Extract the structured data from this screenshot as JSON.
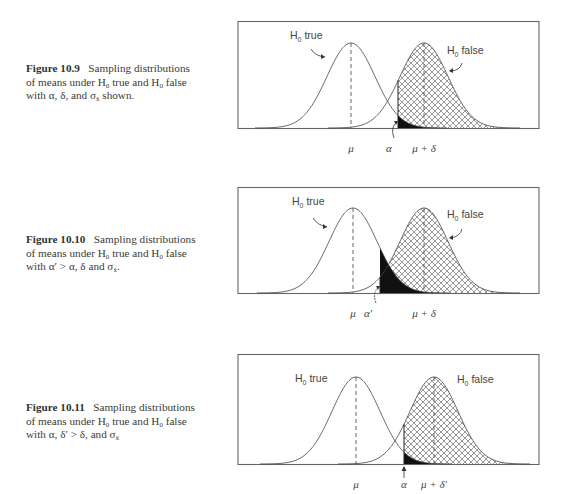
{
  "figures": [
    {
      "id": "fig-10-9",
      "caption": {
        "label": "Figure 10.9",
        "line1_text": "Sampling distributions",
        "line2_a": "of means under H",
        "line2_sub1": "0",
        "line2_b": " true and H",
        "line2_sub2": "0",
        "line2_c": " false",
        "line3": "with α, δ, and σ",
        "line3_sub": "x̄",
        "line3_end": " shown."
      },
      "top": 21,
      "caption_top": 62,
      "labels": {
        "h0_true": "H",
        "h0_false": "H",
        "sub": "0",
        "true_word": " true",
        "false_word": " false"
      },
      "axis": {
        "mu": "μ",
        "alpha": "α",
        "mu_delta": "μ  +  δ"
      },
      "params": {
        "mu_x": 114,
        "alt_x": 187,
        "crit_x": 161,
        "sigma": 24,
        "peak_y": 22,
        "base_y": 107,
        "width": 302
      }
    },
    {
      "id": "fig-10-10",
      "caption": {
        "label": "Figure 10.10",
        "line1_text": "Sampling distributions",
        "line2_a": "of means under H",
        "line2_sub1": "0",
        "line2_b": " true and H",
        "line2_sub2": "0",
        "line2_c": " false",
        "line3": "with α′ > α, δ and σ",
        "line3_sub": "x̄",
        "line3_end": "."
      },
      "top": 187,
      "caption_top": 233,
      "labels": {
        "h0_true": "H",
        "h0_false": "H",
        "sub": "0",
        "true_word": " true",
        "false_word": " false"
      },
      "axis": {
        "mu": "μ",
        "alpha": "α′",
        "mu_delta": "μ  +  δ"
      },
      "params": {
        "mu_x": 116,
        "alt_x": 187,
        "crit_x": 143,
        "sigma": 24,
        "peak_y": 21,
        "base_y": 106,
        "width": 302
      }
    },
    {
      "id": "fig-10-11",
      "caption": {
        "label": "Figure 10.11",
        "line1_text": "Sampling distributions",
        "line2_a": "of means under H",
        "line2_sub1": "0",
        "line2_b": " true and H",
        "line2_sub2": "0",
        "line2_c": " false",
        "line3": "with α, δ′ > δ, and σ",
        "line3_sub": "x̄",
        "line3_end": ""
      },
      "top": 354,
      "caption_top": 401,
      "labels": {
        "h0_true": "H",
        "h0_false": "H",
        "sub": "0",
        "true_word": " true",
        "false_word": " false"
      },
      "axis": {
        "mu": "μ",
        "alpha": "α",
        "mu_delta": "μ + δ′"
      },
      "params": {
        "mu_x": 119,
        "alt_x": 197,
        "crit_x": 167,
        "sigma": 24,
        "peak_y": 23,
        "base_y": 110,
        "width": 302
      }
    }
  ]
}
